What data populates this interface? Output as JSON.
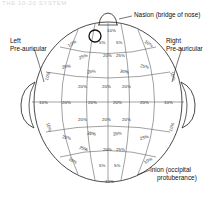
{
  "figure": {
    "title_artifact": "THE 10-20 SYSTEM",
    "type": "anatomical-diagram",
    "colors": {
      "outline": "#1a1a1a",
      "grid": "#4a4a4a",
      "text": "#101010",
      "background": "#ffffff"
    }
  },
  "landmarks": [
    {
      "id": "nasion",
      "label": "Nasion (bridge of nose)",
      "position": "top"
    },
    {
      "id": "left-preauricular",
      "label_line1": "Left",
      "label_line2": "Pre-auricular",
      "position": "left"
    },
    {
      "id": "right-preauricular",
      "label_line1": "Right",
      "label_line2": "Pre-auricular",
      "position": "right"
    },
    {
      "id": "inion",
      "label_line1": "Inion (occipital",
      "label_line2": "protuberance)",
      "position": "bottom"
    }
  ],
  "measurements": {
    "top_nasion": "10%",
    "bottom_inion": "10%",
    "near_vertex_left": "5%",
    "near_vertex_right": "5%",
    "bottom_center_left": "5%",
    "bottom_center_right": "5%",
    "front_left_arc": "10%",
    "front_right_arc": "10%",
    "back_left_arc": "10%",
    "back_right_arc": "10%",
    "left_ear_upper": "10%",
    "left_ear_mid": "10%",
    "left_ear_lower": "10%",
    "right_ear_upper": "10%",
    "right_ear_mid": "10%",
    "right_ear_lower": "10%",
    "equator_row": [
      "10%",
      "20%",
      "20%",
      "20%",
      "20%",
      "10%"
    ],
    "upper_band": [
      "25%",
      "20%",
      "25%",
      "20%",
      "20%",
      "25%",
      "20%",
      "20%",
      "25%",
      "25%"
    ],
    "lower_band": [
      "20%",
      "25%",
      "20%",
      "20%",
      "25%",
      "25%",
      "20%",
      "25%",
      "20%",
      "20%"
    ]
  },
  "percent_labels": [
    {
      "text": "10%",
      "x": 107,
      "y": 29,
      "rot": 0
    },
    {
      "text": "5%",
      "x": 99,
      "y": 41,
      "rot": 0
    },
    {
      "text": "5%",
      "x": 116,
      "y": 41,
      "rot": 0
    },
    {
      "text": "10%",
      "x": 68,
      "y": 42,
      "rot": -32
    },
    {
      "text": "10%",
      "x": 144,
      "y": 42,
      "rot": 32
    },
    {
      "text": "25%",
      "x": 79,
      "y": 55,
      "rot": -20
    },
    {
      "text": "20%",
      "x": 103,
      "y": 54,
      "rot": 0
    },
    {
      "text": "25%",
      "x": 116,
      "y": 54,
      "rot": 0
    },
    {
      "text": "20%",
      "x": 62,
      "y": 65,
      "rot": -10
    },
    {
      "text": "25%",
      "x": 140,
      "y": 65,
      "rot": 12
    },
    {
      "text": "25%",
      "x": 87,
      "y": 70,
      "rot": -8
    },
    {
      "text": "20%",
      "x": 120,
      "y": 70,
      "rot": 8
    },
    {
      "text": "10%",
      "x": 44,
      "y": 74,
      "rot": -72
    },
    {
      "text": "10%",
      "x": 168,
      "y": 74,
      "rot": 72
    },
    {
      "text": "20%",
      "x": 78,
      "y": 85,
      "rot": 0
    },
    {
      "text": "20%",
      "x": 102,
      "y": 85,
      "rot": 0
    },
    {
      "text": "20%",
      "x": 122,
      "y": 85,
      "rot": 0
    },
    {
      "text": "10%",
      "x": 39,
      "y": 101,
      "rot": 0
    },
    {
      "text": "20%",
      "x": 62,
      "y": 101,
      "rot": 0
    },
    {
      "text": "20%",
      "x": 88,
      "y": 101,
      "rot": 0
    },
    {
      "text": "20%",
      "x": 113,
      "y": 101,
      "rot": 0
    },
    {
      "text": "20%",
      "x": 140,
      "y": 101,
      "rot": 0
    },
    {
      "text": "10%",
      "x": 164,
      "y": 101,
      "rot": 0
    },
    {
      "text": "20%",
      "x": 78,
      "y": 118,
      "rot": 0
    },
    {
      "text": "20%",
      "x": 102,
      "y": 118,
      "rot": 0
    },
    {
      "text": "20%",
      "x": 122,
      "y": 118,
      "rot": 0
    },
    {
      "text": "10%",
      "x": 44,
      "y": 125,
      "rot": 72
    },
    {
      "text": "10%",
      "x": 168,
      "y": 125,
      "rot": -72
    },
    {
      "text": "25%",
      "x": 87,
      "y": 132,
      "rot": 8
    },
    {
      "text": "25%",
      "x": 113,
      "y": 132,
      "rot": -8
    },
    {
      "text": "25%",
      "x": 62,
      "y": 136,
      "rot": 14
    },
    {
      "text": "25%",
      "x": 140,
      "y": 136,
      "rot": -14
    },
    {
      "text": "25%",
      "x": 79,
      "y": 147,
      "rot": 20
    },
    {
      "text": "20%",
      "x": 103,
      "y": 148,
      "rot": 0
    },
    {
      "text": "25%",
      "x": 116,
      "y": 148,
      "rot": 0
    },
    {
      "text": "10%",
      "x": 68,
      "y": 159,
      "rot": 30
    },
    {
      "text": "10%",
      "x": 144,
      "y": 159,
      "rot": -30
    },
    {
      "text": "5%",
      "x": 99,
      "y": 164,
      "rot": 0
    },
    {
      "text": "5%",
      "x": 114,
      "y": 164,
      "rot": 0
    },
    {
      "text": "10%",
      "x": 105,
      "y": 180,
      "rot": 0
    }
  ]
}
